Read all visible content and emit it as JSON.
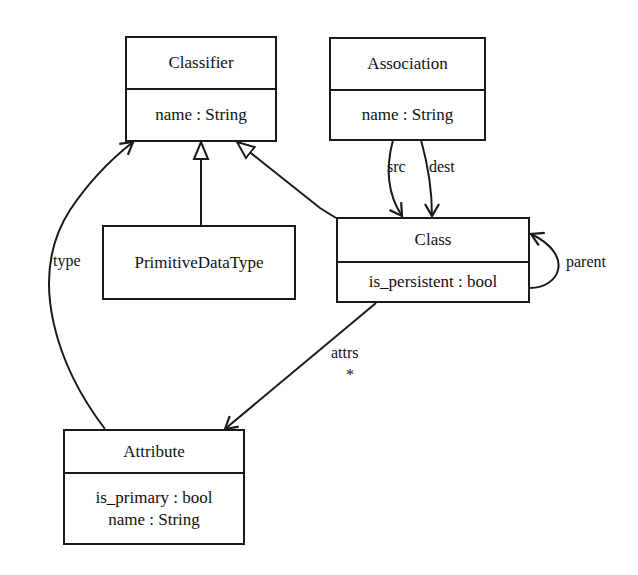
{
  "diagram": {
    "type": "UML class diagram",
    "colors": {
      "line": "#1a1a1a",
      "background": "#ffffff"
    },
    "classes": {
      "classifier": {
        "name": "Classifier",
        "attributes": [
          "name : String"
        ]
      },
      "association": {
        "name": "Association",
        "attributes": [
          "name : String"
        ]
      },
      "primitive": {
        "name": "PrimitiveDataType",
        "attributes": []
      },
      "class": {
        "name": "Class",
        "attributes": [
          "is_persistent : bool"
        ]
      },
      "attribute": {
        "name": "Attribute",
        "attributes": [
          "is_primary : bool",
          "name : String"
        ]
      }
    },
    "relations": {
      "src": {
        "label": "src",
        "from": "Association",
        "to": "Class",
        "kind": "association"
      },
      "dest": {
        "label": "dest",
        "from": "Association",
        "to": "Class",
        "kind": "association"
      },
      "parent": {
        "label": "parent",
        "from": "Class",
        "to": "Class",
        "kind": "association"
      },
      "attrs": {
        "label": "attrs",
        "multiplicity": "*",
        "from": "Class",
        "to": "Attribute",
        "kind": "association"
      },
      "type": {
        "label": "type",
        "from": "Attribute",
        "to": "Classifier",
        "kind": "association"
      },
      "gen_primitive": {
        "from": "PrimitiveDataType",
        "to": "Classifier",
        "kind": "generalization"
      },
      "gen_class": {
        "from": "Class",
        "to": "Classifier",
        "kind": "generalization"
      }
    }
  }
}
